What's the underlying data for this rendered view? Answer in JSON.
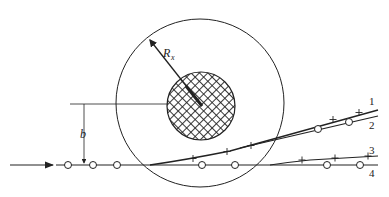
{
  "figure": {
    "labels": {
      "radius": "R",
      "radius_subscript": "x",
      "impact_parameter": "b",
      "track_1": "1",
      "track_2": "2",
      "track_3": "3",
      "track_4": "4"
    },
    "colors": {
      "line": "#222222",
      "background": "#ffffff"
    },
    "elements": {
      "outer_circle": {
        "cx": 200,
        "cy": 103,
        "r": 84
      },
      "inner_circle_hatched": {
        "cx": 201,
        "cy": 106,
        "r": 34
      },
      "incoming_arrow": {
        "from": [
          10,
          165
        ],
        "to": [
          54,
          165
        ]
      },
      "tracks": [
        {
          "id": "1",
          "marker": "plus"
        },
        {
          "id": "2",
          "marker": "circle"
        },
        {
          "id": "3",
          "marker": "plus"
        },
        {
          "id": "4",
          "marker": "circle"
        }
      ]
    }
  }
}
